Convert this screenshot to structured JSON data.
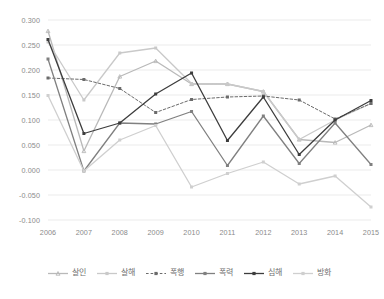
{
  "chart_data": {
    "type": "line",
    "title": "",
    "subtitle": "",
    "xlabel": "",
    "ylabel": "",
    "categories": [
      "2006",
      "2007",
      "2008",
      "2009",
      "2010",
      "2011",
      "2012",
      "2013",
      "2014",
      "2015"
    ],
    "x": [
      2006,
      2007,
      2008,
      2009,
      2010,
      2011,
      2012,
      2013,
      2014,
      2015
    ],
    "ylim": [
      -0.1,
      0.3
    ],
    "xlim": [
      2006,
      2015
    ],
    "ytick_labels": [
      "0.300",
      "0.250",
      "0.200",
      "0.150",
      "0.100",
      "0.050",
      "0.000",
      "-0.050",
      "-0.100"
    ],
    "ytick_values": [
      0.3,
      0.25,
      0.2,
      0.15,
      0.1,
      0.05,
      0.0,
      -0.05,
      -0.1
    ],
    "ytick_step": 0.05,
    "grid": "horizontal",
    "legend_position": "bottom",
    "series": [
      {
        "name": "살인",
        "color": "#b9b9b9",
        "marker": "triangle",
        "dash": "solid",
        "values": [
          0.278,
          0.038,
          0.187,
          0.218,
          0.172,
          0.172,
          0.157,
          0.061,
          0.055,
          0.09
        ]
      },
      {
        "name": "살해",
        "color": "#c9c9c9",
        "marker": "square",
        "dash": "solid",
        "values": [
          0.256,
          0.14,
          0.234,
          0.244,
          0.173,
          0.172,
          0.157,
          0.061,
          0.1,
          0.133
        ]
      },
      {
        "name": "폭행",
        "color": "#6b6b6b",
        "marker": "square",
        "dash": "dashed",
        "values": [
          0.184,
          0.181,
          0.163,
          0.115,
          0.141,
          0.146,
          0.148,
          0.14,
          0.102,
          0.133
        ]
      },
      {
        "name": "폭력",
        "color": "#808080",
        "marker": "square",
        "dash": "solid",
        "values": [
          0.222,
          -0.002,
          0.094,
          0.092,
          0.117,
          0.009,
          0.108,
          0.013,
          0.094,
          0.011
        ]
      },
      {
        "name": "심해",
        "color": "#3d3d3d",
        "marker": "square",
        "dash": "solid",
        "values": [
          0.261,
          0.073,
          0.094,
          0.152,
          0.194,
          0.059,
          0.146,
          0.031,
          0.1,
          0.139
        ]
      },
      {
        "name": "방화",
        "color": "#cfcfcf",
        "marker": "square",
        "dash": "solid",
        "values": [
          0.149,
          -0.002,
          0.06,
          0.089,
          -0.034,
          -0.007,
          0.016,
          -0.028,
          -0.012,
          -0.074
        ]
      }
    ]
  }
}
